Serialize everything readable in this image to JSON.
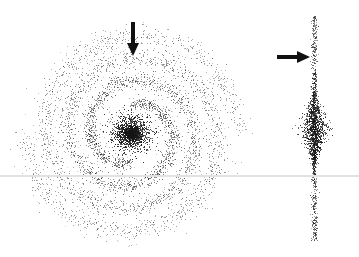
{
  "figure": {
    "width": 359,
    "height": 257,
    "background": "#ffffff",
    "point_color": "#1a1a1a",
    "scan_line": {
      "y": 175,
      "color": "#e2e2e2"
    },
    "face_on_galaxy": {
      "center": [
        131,
        133
      ],
      "bulge": {
        "radius": 20,
        "count": 1800
      },
      "arms": 2,
      "arm_turns": 1.75,
      "inner_radius": 30,
      "outer_radius": 108,
      "arm_width": 9,
      "arm_count": 3800,
      "halo_count": 400
    },
    "edge_on_galaxy": {
      "center": [
        314,
        128
      ],
      "bulge": {
        "half_width": 14,
        "half_height": 40,
        "count": 1300
      },
      "disk": {
        "half_width": 2.5,
        "half_height": 112,
        "count": 700
      }
    },
    "arrows": [
      {
        "name": "face-on-arrow",
        "direction": "down",
        "tail": [
          133,
          22
        ],
        "head": [
          133,
          56
        ],
        "color": "#111111"
      },
      {
        "name": "edge-on-arrow",
        "direction": "right",
        "tail": [
          277,
          57
        ],
        "head": [
          310,
          57
        ],
        "color": "#111111"
      }
    ]
  }
}
